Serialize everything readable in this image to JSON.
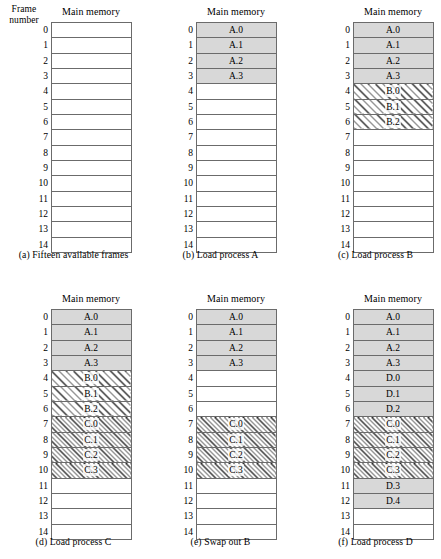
{
  "figure": {
    "frame_number_label_line1": "Frame",
    "frame_number_label_line2": "number",
    "main_memory_title": "Main memory",
    "frame_numbers": [
      "0",
      "1",
      "2",
      "3",
      "4",
      "5",
      "6",
      "7",
      "8",
      "9",
      "10",
      "11",
      "12",
      "13",
      "14"
    ],
    "fill_legend": {
      "empty": "#ffffff",
      "process_a_d_gray": "#d8d8d8",
      "process_b_hatch": "coarse-diagonal-hatch",
      "process_c_hatch": "dense-diagonal-hatch"
    }
  },
  "panels": [
    {
      "id": "a",
      "caption": "(a) Fifteen available frames",
      "show_frame_heading": true,
      "frames": [
        {
          "label": "",
          "fill": "empty"
        },
        {
          "label": "",
          "fill": "empty"
        },
        {
          "label": "",
          "fill": "empty"
        },
        {
          "label": "",
          "fill": "empty"
        },
        {
          "label": "",
          "fill": "empty"
        },
        {
          "label": "",
          "fill": "empty"
        },
        {
          "label": "",
          "fill": "empty"
        },
        {
          "label": "",
          "fill": "empty"
        },
        {
          "label": "",
          "fill": "empty"
        },
        {
          "label": "",
          "fill": "empty"
        },
        {
          "label": "",
          "fill": "empty"
        },
        {
          "label": "",
          "fill": "empty"
        },
        {
          "label": "",
          "fill": "empty"
        },
        {
          "label": "",
          "fill": "empty"
        },
        {
          "label": "",
          "fill": "empty"
        }
      ]
    },
    {
      "id": "b",
      "caption": "(b) Load process A",
      "show_frame_heading": false,
      "frames": [
        {
          "label": "A.0",
          "fill": "gray"
        },
        {
          "label": "A.1",
          "fill": "gray"
        },
        {
          "label": "A.2",
          "fill": "gray"
        },
        {
          "label": "A.3",
          "fill": "gray"
        },
        {
          "label": "",
          "fill": "empty"
        },
        {
          "label": "",
          "fill": "empty"
        },
        {
          "label": "",
          "fill": "empty"
        },
        {
          "label": "",
          "fill": "empty"
        },
        {
          "label": "",
          "fill": "empty"
        },
        {
          "label": "",
          "fill": "empty"
        },
        {
          "label": "",
          "fill": "empty"
        },
        {
          "label": "",
          "fill": "empty"
        },
        {
          "label": "",
          "fill": "empty"
        },
        {
          "label": "",
          "fill": "empty"
        },
        {
          "label": "",
          "fill": "empty"
        }
      ]
    },
    {
      "id": "c",
      "caption": "(c) Load process B",
      "show_frame_heading": false,
      "frames": [
        {
          "label": "A.0",
          "fill": "gray"
        },
        {
          "label": "A.1",
          "fill": "gray"
        },
        {
          "label": "A.2",
          "fill": "gray"
        },
        {
          "label": "A.3",
          "fill": "gray"
        },
        {
          "label": "B.0",
          "fill": "hatch-wide"
        },
        {
          "label": "B.1",
          "fill": "hatch-wide"
        },
        {
          "label": "B.2",
          "fill": "hatch-wide"
        },
        {
          "label": "",
          "fill": "empty"
        },
        {
          "label": "",
          "fill": "empty"
        },
        {
          "label": "",
          "fill": "empty"
        },
        {
          "label": "",
          "fill": "empty"
        },
        {
          "label": "",
          "fill": "empty"
        },
        {
          "label": "",
          "fill": "empty"
        },
        {
          "label": "",
          "fill": "empty"
        },
        {
          "label": "",
          "fill": "empty"
        }
      ]
    },
    {
      "id": "d",
      "caption": "(d) Load process C",
      "show_frame_heading": false,
      "frames": [
        {
          "label": "A.0",
          "fill": "gray"
        },
        {
          "label": "A.1",
          "fill": "gray"
        },
        {
          "label": "A.2",
          "fill": "gray"
        },
        {
          "label": "A.3",
          "fill": "gray"
        },
        {
          "label": "B.0",
          "fill": "hatch-wide"
        },
        {
          "label": "B.1",
          "fill": "hatch-wide"
        },
        {
          "label": "B.2",
          "fill": "hatch-wide"
        },
        {
          "label": "C.0",
          "fill": "hatch-dense"
        },
        {
          "label": "C.1",
          "fill": "hatch-dense"
        },
        {
          "label": "C.2",
          "fill": "hatch-dense"
        },
        {
          "label": "C.3",
          "fill": "hatch-dense"
        },
        {
          "label": "",
          "fill": "empty"
        },
        {
          "label": "",
          "fill": "empty"
        },
        {
          "label": "",
          "fill": "empty"
        },
        {
          "label": "",
          "fill": "empty"
        }
      ]
    },
    {
      "id": "e",
      "caption": "(e) Swap out B",
      "show_frame_heading": false,
      "frames": [
        {
          "label": "A.0",
          "fill": "gray"
        },
        {
          "label": "A.1",
          "fill": "gray"
        },
        {
          "label": "A.2",
          "fill": "gray"
        },
        {
          "label": "A.3",
          "fill": "gray"
        },
        {
          "label": "",
          "fill": "empty"
        },
        {
          "label": "",
          "fill": "empty"
        },
        {
          "label": "",
          "fill": "empty"
        },
        {
          "label": "C.0",
          "fill": "hatch-dense"
        },
        {
          "label": "C.1",
          "fill": "hatch-dense"
        },
        {
          "label": "C.2",
          "fill": "hatch-dense"
        },
        {
          "label": "C.3",
          "fill": "hatch-dense"
        },
        {
          "label": "",
          "fill": "empty"
        },
        {
          "label": "",
          "fill": "empty"
        },
        {
          "label": "",
          "fill": "empty"
        },
        {
          "label": "",
          "fill": "empty"
        }
      ]
    },
    {
      "id": "f",
      "caption": "(f) Load process D",
      "show_frame_heading": false,
      "frames": [
        {
          "label": "A.0",
          "fill": "gray"
        },
        {
          "label": "A.1",
          "fill": "gray"
        },
        {
          "label": "A.2",
          "fill": "gray"
        },
        {
          "label": "A.3",
          "fill": "gray"
        },
        {
          "label": "D.0",
          "fill": "gray"
        },
        {
          "label": "D.1",
          "fill": "gray"
        },
        {
          "label": "D.2",
          "fill": "gray"
        },
        {
          "label": "C.0",
          "fill": "hatch-dense"
        },
        {
          "label": "C.1",
          "fill": "hatch-dense"
        },
        {
          "label": "C.2",
          "fill": "hatch-dense"
        },
        {
          "label": "C.3",
          "fill": "hatch-dense"
        },
        {
          "label": "D.3",
          "fill": "gray"
        },
        {
          "label": "D.4",
          "fill": "gray"
        },
        {
          "label": "",
          "fill": "empty"
        },
        {
          "label": "",
          "fill": "empty"
        }
      ]
    }
  ]
}
